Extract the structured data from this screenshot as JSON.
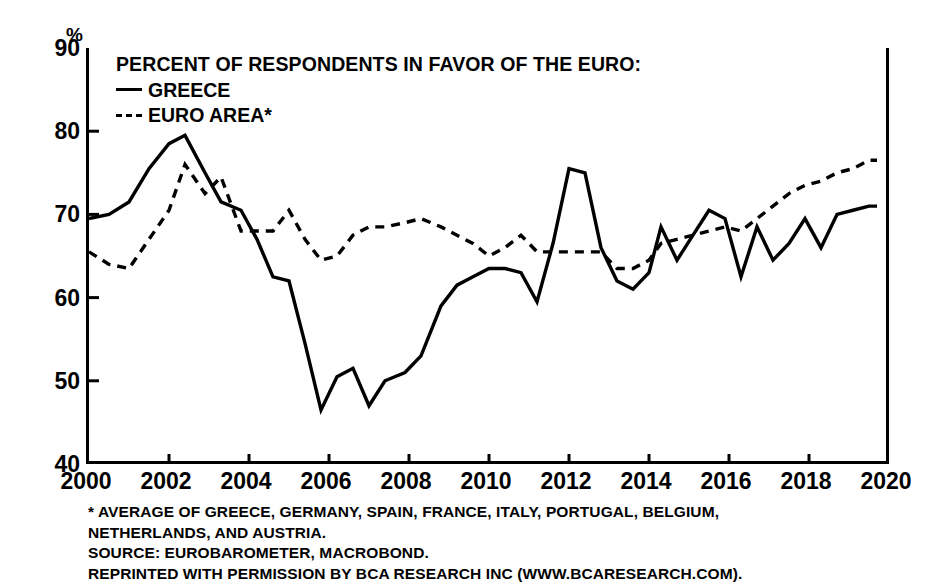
{
  "axis": {
    "unit_label": "%",
    "y_ticks": [
      40,
      50,
      60,
      70,
      80,
      90
    ],
    "x_ticks": [
      2000,
      2002,
      2004,
      2006,
      2008,
      2010,
      2012,
      2014,
      2016,
      2018,
      2020
    ]
  },
  "legend": {
    "title": "PERCENT OF RESPONDENTS IN FAVOR OF THE EURO:",
    "items": [
      {
        "label": "GREECE",
        "style": "solid"
      },
      {
        "label": "EURO AREA*",
        "style": "dashed"
      }
    ]
  },
  "footnotes": [
    "* AVERAGE OF GREECE, GERMANY, SPAIN, FRANCE, ITALY, PORTUGAL, BELGIUM,",
    "NETHERLANDS, AND AUSTRIA.",
    "SOURCE: EUROBAROMETER, MACROBOND.",
    "REPRINTED WITH PERMISSION BY BCA RESEARCH INC (WWW.BCARESEARCH.COM)."
  ],
  "chart_data": {
    "type": "line",
    "title": "PERCENT OF RESPONDENTS IN FAVOR OF THE EURO:",
    "xlabel": "",
    "ylabel": "%",
    "xlim": [
      2000,
      2020
    ],
    "ylim": [
      40,
      90
    ],
    "grid": false,
    "legend_position": "top-left",
    "line_color": "#000000",
    "series": [
      {
        "name": "GREECE",
        "style": "solid",
        "x": [
          2000.0,
          2000.5,
          2001.0,
          2001.5,
          2002.0,
          2002.4,
          2002.9,
          2003.3,
          2003.8,
          2004.2,
          2004.6,
          2005.0,
          2005.4,
          2005.8,
          2006.2,
          2006.6,
          2007.0,
          2007.4,
          2007.9,
          2008.3,
          2008.8,
          2009.2,
          2009.6,
          2010.0,
          2010.4,
          2010.8,
          2011.2,
          2011.6,
          2012.0,
          2012.4,
          2012.8,
          2013.2,
          2013.6,
          2014.0,
          2014.3,
          2014.7,
          2015.1,
          2015.5,
          2015.9,
          2016.3,
          2016.7,
          2017.1,
          2017.5,
          2017.9,
          2018.3,
          2018.7,
          2019.1,
          2019.5,
          2019.7
        ],
        "values": [
          69.5,
          70.0,
          71.5,
          75.5,
          78.5,
          79.5,
          75.0,
          71.5,
          70.5,
          67.0,
          62.5,
          62.0,
          54.5,
          46.5,
          50.5,
          51.5,
          47.0,
          50.0,
          51.0,
          53.0,
          59.0,
          61.5,
          62.5,
          63.5,
          63.5,
          63.0,
          59.5,
          66.5,
          75.5,
          75.0,
          66.0,
          62.0,
          61.0,
          63.0,
          68.5,
          64.5,
          67.5,
          70.5,
          69.5,
          62.5,
          68.5,
          64.5,
          66.5,
          69.5,
          66.0,
          70.0,
          70.5,
          71.0,
          71.0
        ]
      },
      {
        "name": "EURO AREA*",
        "style": "dashed",
        "x": [
          2000.0,
          2000.5,
          2001.0,
          2001.5,
          2002.0,
          2002.4,
          2002.9,
          2003.3,
          2003.8,
          2004.2,
          2004.6,
          2005.0,
          2005.4,
          2005.8,
          2006.2,
          2006.6,
          2007.0,
          2007.4,
          2007.9,
          2008.3,
          2008.8,
          2009.2,
          2009.6,
          2010.0,
          2010.4,
          2010.8,
          2011.2,
          2011.6,
          2012.0,
          2012.4,
          2012.8,
          2013.2,
          2013.6,
          2014.0,
          2014.3,
          2014.7,
          2015.1,
          2015.5,
          2015.9,
          2016.3,
          2016.7,
          2017.1,
          2017.5,
          2017.9,
          2018.3,
          2018.7,
          2019.1,
          2019.5,
          2019.7
        ],
        "values": [
          65.5,
          64.0,
          63.5,
          67.0,
          70.5,
          76.0,
          72.5,
          74.5,
          68.0,
          68.0,
          68.0,
          70.5,
          67.0,
          64.5,
          65.0,
          67.5,
          68.5,
          68.5,
          69.0,
          69.5,
          68.5,
          67.5,
          66.5,
          65.0,
          66.0,
          67.5,
          65.5,
          65.5,
          65.5,
          65.5,
          65.5,
          63.5,
          63.5,
          64.5,
          66.5,
          67.0,
          67.5,
          68.0,
          68.5,
          68.0,
          69.5,
          71.0,
          72.5,
          73.5,
          74.0,
          75.0,
          75.5,
          76.5,
          76.5
        ]
      }
    ]
  }
}
